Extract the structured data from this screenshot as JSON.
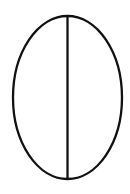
{
  "diagram": {
    "type": "ellipse-with-major-axis",
    "canvas": {
      "width": 130,
      "height": 194,
      "background": "#ffffff"
    },
    "stroke_color": "#111111",
    "stroke_width": 2.3,
    "ellipse": {
      "cx": 67.5,
      "cy": 97.5,
      "rx": 54.5,
      "ry": 81.5
    },
    "axis_line": {
      "x1": 67.5,
      "y1": 16,
      "x2": 67.5,
      "y2": 179
    }
  }
}
